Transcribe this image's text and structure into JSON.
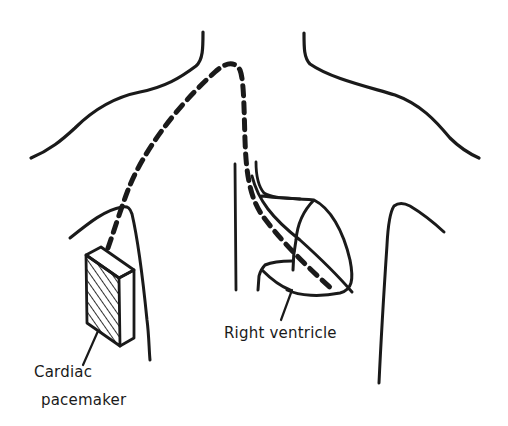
{
  "diagram": {
    "type": "anatomical-illustration",
    "colors": {
      "line": "#1a1a1a",
      "background": "#ffffff"
    },
    "labels": {
      "pacemaker_line1": "Cardiac",
      "pacemaker_line2": "pacemaker",
      "ventricle": "Right ventricle"
    },
    "elements": [
      {
        "name": "left-shoulder-outline",
        "style": "solid"
      },
      {
        "name": "right-shoulder-outline",
        "style": "solid"
      },
      {
        "name": "pacemaker-device",
        "style": "hatched box"
      },
      {
        "name": "pacing-lead",
        "style": "dashed"
      },
      {
        "name": "heart-outline",
        "style": "solid"
      },
      {
        "name": "sternum-lines",
        "style": "solid"
      },
      {
        "name": "right-torso-outline",
        "style": "solid"
      }
    ]
  }
}
